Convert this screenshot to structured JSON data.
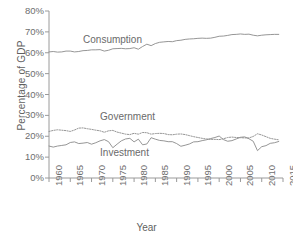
{
  "chart_data": {
    "type": "line",
    "title": "",
    "xlabel": "Year",
    "ylabel": "Percentage of GDP",
    "xlim": [
      1960,
      2015
    ],
    "ylim": [
      0,
      80
    ],
    "grid": false,
    "legend_position": "inline-labels",
    "xticks": [
      "1960",
      "1965",
      "1970",
      "1975",
      "1980",
      "1985",
      "1990",
      "1995",
      "2000",
      "2005",
      "2010",
      "2015"
    ],
    "yticks": [
      "0%",
      "10%",
      "20%",
      "30%",
      "40%",
      "50%",
      "60%",
      "70%",
      "80%"
    ],
    "x": [
      1960,
      1961,
      1962,
      1963,
      1964,
      1965,
      1966,
      1967,
      1968,
      1969,
      1970,
      1971,
      1972,
      1973,
      1974,
      1975,
      1976,
      1977,
      1978,
      1979,
      1980,
      1981,
      1982,
      1983,
      1984,
      1985,
      1986,
      1987,
      1988,
      1989,
      1990,
      1991,
      1992,
      1993,
      1994,
      1995,
      1996,
      1997,
      1998,
      1999,
      2000,
      2001,
      2002,
      2003,
      2004,
      2005,
      2006,
      2007,
      2008,
      2009,
      2010,
      2011,
      2012,
      2013,
      2014
    ],
    "series": [
      {
        "name": "Consumption",
        "style": "solid",
        "color": "#8a8a8a",
        "label_x": 1968,
        "label_y": 66,
        "values": [
          60.4,
          60.6,
          60.3,
          60.4,
          60.8,
          60.8,
          60.4,
          60.6,
          61.0,
          61.1,
          61.4,
          61.4,
          61.5,
          60.8,
          61.2,
          61.9,
          62.0,
          62.1,
          61.9,
          62.0,
          62.4,
          61.7,
          63.0,
          64.1,
          63.4,
          64.4,
          65.0,
          65.2,
          65.4,
          65.3,
          65.8,
          66.0,
          66.4,
          66.6,
          66.7,
          66.9,
          67.0,
          66.9,
          67.0,
          67.4,
          67.9,
          68.0,
          68.3,
          68.7,
          68.8,
          69.0,
          68.8,
          68.9,
          68.4,
          68.1,
          68.4,
          68.6,
          68.7,
          68.8,
          68.8
        ]
      },
      {
        "name": "Government",
        "style": "dotted",
        "color": "#8a8a8a",
        "label_x": 1972,
        "label_y": 29,
        "values": [
          22.3,
          22.8,
          23.1,
          22.9,
          22.7,
          22.3,
          23.0,
          23.9,
          24.0,
          23.6,
          23.3,
          22.9,
          22.6,
          21.9,
          22.6,
          22.8,
          22.0,
          21.5,
          21.0,
          20.8,
          21.4,
          21.0,
          21.8,
          21.7,
          21.0,
          21.3,
          21.4,
          21.3,
          20.8,
          20.7,
          21.0,
          21.1,
          20.8,
          20.3,
          19.8,
          19.4,
          19.0,
          18.7,
          18.5,
          18.5,
          18.4,
          18.8,
          19.4,
          19.6,
          19.4,
          19.3,
          19.2,
          19.2,
          19.9,
          21.2,
          20.6,
          19.8,
          19.0,
          18.6,
          18.3
        ]
      },
      {
        "name": "Investment",
        "style": "solid",
        "color": "#8a8a8a",
        "label_x": 1972,
        "label_y": 12,
        "values": [
          15.3,
          14.8,
          15.3,
          15.6,
          15.9,
          17.0,
          17.3,
          16.5,
          16.7,
          17.0,
          16.2,
          16.9,
          17.8,
          18.4,
          17.4,
          14.5,
          16.2,
          17.8,
          18.7,
          19.0,
          17.3,
          18.6,
          15.9,
          16.3,
          19.3,
          18.6,
          18.0,
          17.8,
          17.4,
          17.4,
          16.5,
          15.2,
          15.7,
          16.3,
          17.3,
          17.4,
          17.9,
          18.3,
          18.9,
          19.4,
          20.1,
          18.4,
          17.6,
          17.9,
          18.7,
          19.5,
          19.7,
          18.8,
          17.6,
          13.1,
          15.0,
          15.5,
          16.6,
          16.9,
          17.5
        ]
      }
    ]
  },
  "axis": {
    "y_title": "Percentage of GDP",
    "x_title": "Year"
  }
}
